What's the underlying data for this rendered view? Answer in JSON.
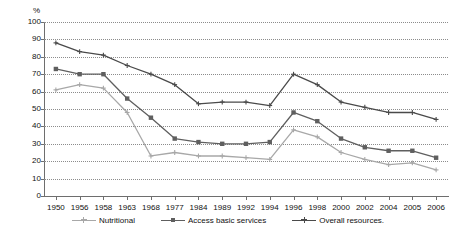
{
  "chart_data": {
    "type": "line",
    "title": "",
    "subtitle": "",
    "xlabel": "",
    "ylabel": "%",
    "ylim": [
      0,
      100
    ],
    "ytick_step": 10,
    "yticks": [
      0,
      10,
      20,
      30,
      40,
      50,
      60,
      70,
      80,
      90,
      100
    ],
    "grid": true,
    "grid_style": "dotted-horizontal",
    "legend_position": "bottom-center",
    "categories": [
      "1950",
      "1956",
      "1958",
      "1963",
      "1968",
      "1977",
      "1984",
      "1989",
      "1992",
      "1994",
      "1996",
      "1998",
      "2000",
      "2002",
      "2004",
      "2005",
      "2006"
    ],
    "series": [
      {
        "name": "Nutritional",
        "color": "#a8a8a8",
        "marker": "plus",
        "values": [
          61,
          64,
          62,
          48,
          23,
          25,
          23,
          23,
          22,
          21,
          38,
          34,
          25,
          21,
          18,
          19,
          15
        ]
      },
      {
        "name": "Access basic services",
        "color": "#5f5f5f",
        "marker": "square",
        "values": [
          73,
          70,
          70,
          56,
          45,
          33,
          31,
          30,
          30,
          31,
          48,
          43,
          33,
          28,
          26,
          26,
          22
        ]
      },
      {
        "name": "Overall resources.",
        "color": "#4a4a4a",
        "marker": "plus",
        "values": [
          88,
          83,
          81,
          75,
          70,
          64,
          53,
          54,
          54,
          52,
          70,
          64,
          54,
          51,
          48,
          48,
          44
        ]
      }
    ]
  },
  "axis": {
    "unit_label": "%"
  },
  "legend": {
    "entries": [
      {
        "label": "Nutritional"
      },
      {
        "label": "Access basic services"
      },
      {
        "label": "Overall resources."
      }
    ]
  },
  "colors": {
    "grid": "#8c8c8c",
    "axis": "#6e6e6e",
    "text": "#111111",
    "series_nutritional": "#a8a8a8",
    "series_access": "#5f5f5f",
    "series_overall": "#4a4a4a"
  }
}
